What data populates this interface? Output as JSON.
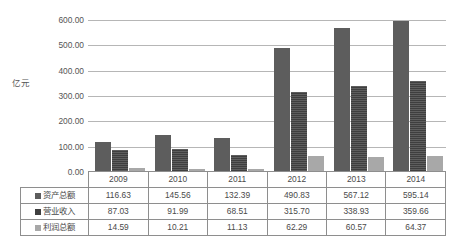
{
  "chart_data": {
    "type": "bar",
    "title": "",
    "subtitle": "",
    "xlabel": "",
    "ylabel": "亿元",
    "categories": [
      "2009",
      "2010",
      "2011",
      "2012",
      "2013",
      "2014"
    ],
    "ylim": [
      0,
      600
    ],
    "ytick_step": 100,
    "ytick_labels": [
      "600.00",
      "500.00",
      "400.00",
      "300.00",
      "200.00",
      "100.00",
      "0.00"
    ],
    "ytick_values": [
      600,
      500,
      400,
      300,
      200,
      100,
      0
    ],
    "grid": true,
    "legend_position": "table-row-labels",
    "series": [
      {
        "name": "资产总额",
        "color": "#5d5d5d",
        "values": [
          116.63,
          145.56,
          132.39,
          490.83,
          567.12,
          595.14
        ],
        "labels": [
          "116.63",
          "145.56",
          "132.39",
          "490.83",
          "567.12",
          "595.14"
        ]
      },
      {
        "name": "营业收入",
        "color": "#3f3f3f",
        "values": [
          87.03,
          91.99,
          68.51,
          315.7,
          338.93,
          359.66
        ],
        "labels": [
          "87.03",
          "91.99",
          "68.51",
          "315.70",
          "338.93",
          "359.66"
        ]
      },
      {
        "name": "利润总额",
        "color": "#a8a8a8",
        "values": [
          14.59,
          10.21,
          11.13,
          62.29,
          60.57,
          64.37
        ],
        "labels": [
          "14.59",
          "10.21",
          "11.13",
          "62.29",
          "60.57",
          "64.37"
        ]
      }
    ]
  },
  "colors": {
    "gridline": "#a9a9a9",
    "table_border": "#8e8e8e",
    "text": "#4a4a4a",
    "background": "#ffffff"
  }
}
